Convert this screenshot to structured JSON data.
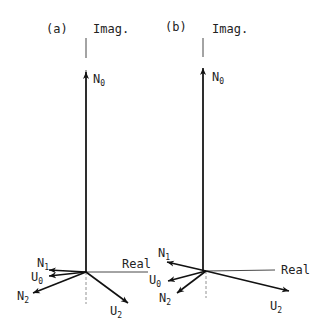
{
  "figure": {
    "panels": [
      {
        "id": "a",
        "tag": "(a)",
        "imag_label": "Imag.",
        "real_label": "Real",
        "vectors": [
          {
            "name": "N",
            "sub": "0"
          },
          {
            "name": "N",
            "sub": "1"
          },
          {
            "name": "U",
            "sub": "0"
          },
          {
            "name": "N",
            "sub": "2"
          },
          {
            "name": "U",
            "sub": "2"
          }
        ]
      },
      {
        "id": "b",
        "tag": "(b)",
        "imag_label": "Imag.",
        "real_label": "Real",
        "vectors": [
          {
            "name": "N",
            "sub": "0"
          },
          {
            "name": "N",
            "sub": "1"
          },
          {
            "name": "U",
            "sub": "0"
          },
          {
            "name": "N",
            "sub": "2"
          },
          {
            "name": "U",
            "sub": "2"
          }
        ]
      }
    ],
    "colors": {
      "ink": "#111111",
      "background": "#ffffff"
    }
  }
}
